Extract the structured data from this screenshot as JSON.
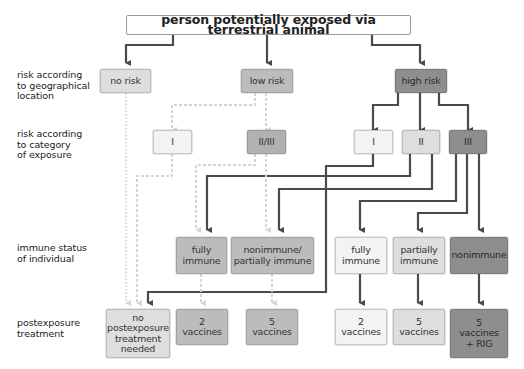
{
  "title": "person potentially exposed via terrestrial animal",
  "row_labels": {
    "geographical": "risk according\nto geographical\nlocation",
    "category": "risk according\nto category\nof exposure",
    "immune": "immune status\nof individual",
    "treatment": "postexposure\ntreatment"
  },
  "geographical_risk": {
    "no_risk": "no risk",
    "low_risk": "low risk",
    "high_risk": "high risk"
  },
  "exposure_category": {
    "low_I": "I",
    "low_II_III": "II/III",
    "high_I": "I",
    "high_II": "II",
    "high_III": "III"
  },
  "immune_status": {
    "low_fully": "fully\nimmune",
    "low_non_partial": "nonimmune/\npartially immune",
    "high_fully": "fully\nimmune",
    "high_partial": "partially\nimmune",
    "high_non": "nonimmune"
  },
  "treatment": {
    "none": "no\npostexposure\ntreatment\nneeded",
    "low_2": "2\nvaccines",
    "low_5": "5\nvaccines",
    "high_2": "2\nvaccines",
    "high_5": "5\nvaccines",
    "high_5_rig": "5\nvaccines\n+ RIG"
  },
  "colors": {
    "solid_arrow": "#4a4a4a",
    "dashed_arrow": "#d4d4d4",
    "box_white": "#f3f3f3",
    "box_light": "#dedede",
    "box_mid": "#bcbcbc",
    "box_dark": "#8e8e8e"
  }
}
